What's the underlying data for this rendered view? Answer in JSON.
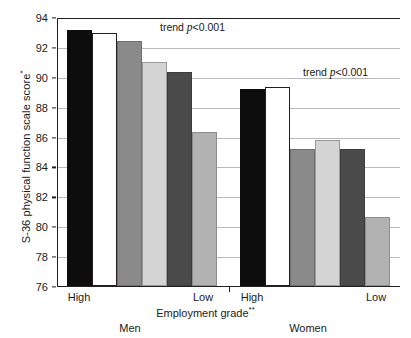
{
  "chart_data": {
    "type": "bar",
    "title": "",
    "ylabel": "S-36 physical function scale score*",
    "ylabel_text": "S-36 physical function scale score",
    "ylabel_sup": "*",
    "xlabel": "Employment grade**",
    "xlabel_text": "Employment grade",
    "xlabel_sup": "**",
    "ylim": [
      76,
      94
    ],
    "ytick_step": 2,
    "yticks": [
      94,
      92,
      90,
      88,
      86,
      84,
      82,
      80,
      78,
      76
    ],
    "grid": true,
    "legend": "none",
    "groups": [
      {
        "name": "Men",
        "axis_start_label": "High",
        "axis_end_label": "Low",
        "annotation": "trend p<0.001",
        "annotation_prefix": "trend ",
        "annotation_italic": "p",
        "annotation_suffix": "<0.001",
        "bars": [
          {
            "grade": "High",
            "value": 93.1,
            "color": "#0d0d0d",
            "style": "black"
          },
          {
            "grade": "High",
            "value": 92.9,
            "color": "#ffffff",
            "style": "white"
          },
          {
            "grade": "Mid",
            "value": 92.4,
            "color": "#8a8a8a",
            "style": "mid"
          },
          {
            "grade": "Mid",
            "value": 91.0,
            "color": "#d4d4d4",
            "style": "light"
          },
          {
            "grade": "Low",
            "value": 90.35,
            "color": "#4a4a4a",
            "style": "dark"
          },
          {
            "grade": "Low",
            "value": 86.3,
            "color": "#b2b2b2",
            "style": "lmid"
          }
        ]
      },
      {
        "name": "Women",
        "axis_start_label": "High",
        "axis_end_label": "Low",
        "annotation": "trend p<0.001",
        "annotation_prefix": "trend ",
        "annotation_italic": "p",
        "annotation_suffix": "<0.001",
        "bars": [
          {
            "grade": "High",
            "value": 89.15,
            "color": "#0d0d0d",
            "style": "black"
          },
          {
            "grade": "High",
            "value": 89.35,
            "color": "#ffffff",
            "style": "white"
          },
          {
            "grade": "Mid",
            "value": 85.15,
            "color": "#8a8a8a",
            "style": "mid"
          },
          {
            "grade": "Mid",
            "value": 85.75,
            "color": "#d4d4d4",
            "style": "light"
          },
          {
            "grade": "Low",
            "value": 85.15,
            "color": "#4a4a4a",
            "style": "dark"
          },
          {
            "grade": "Low",
            "value": 80.65,
            "color": "#b2b2b2",
            "style": "lmid"
          }
        ]
      }
    ]
  },
  "axis": {
    "y_title_text": "S-36 physical function scale score",
    "y_title_sup": "*",
    "x_title_text": "Employment grade",
    "x_title_sup": "**"
  }
}
